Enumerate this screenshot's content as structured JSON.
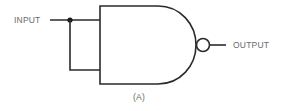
{
  "diagram": {
    "type": "logic-gate",
    "gate": "NAND",
    "configuration": "inputs tied together (inverter)",
    "labels": {
      "input": "INPUT",
      "output": "OUTPUT",
      "caption": "(A)"
    },
    "colors": {
      "line": "#2a2a2a",
      "text": "#6a6a6a",
      "background": "#ffffff"
    },
    "components": [
      {
        "id": "input-wire",
        "kind": "wire"
      },
      {
        "id": "junction-dot",
        "kind": "junction"
      },
      {
        "id": "tie-wire",
        "kind": "wire"
      },
      {
        "id": "nand-gate-body",
        "kind": "gate"
      },
      {
        "id": "inversion-bubble",
        "kind": "bubble"
      },
      {
        "id": "output-wire",
        "kind": "wire"
      }
    ]
  }
}
